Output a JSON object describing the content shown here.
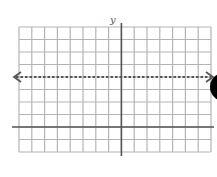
{
  "chart_data": {
    "type": "line",
    "title": "",
    "xlabel": "",
    "ylabel": "y",
    "grid": true,
    "xlim": [
      -8,
      7
    ],
    "ylim": [
      -2,
      8
    ],
    "series": [
      {
        "name": "y = 4",
        "style": "dashed",
        "arrows": "both",
        "x": [
          -8,
          7
        ],
        "values": [
          4,
          4
        ]
      }
    ],
    "annotations": []
  },
  "colors": {
    "grid": "#b4b4b4",
    "axis": "#555555",
    "line": "#555555",
    "blob": "#000000"
  },
  "labels": {
    "y_axis": "y"
  }
}
